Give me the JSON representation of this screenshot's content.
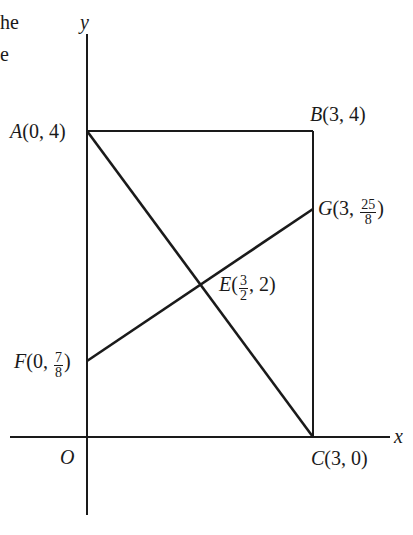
{
  "cut_text": {
    "line1": "he",
    "line2": "e"
  },
  "axes": {
    "x_label": "x",
    "y_label": "y",
    "origin_label": "O"
  },
  "points": {
    "A": {
      "name": "A",
      "coords": "(0, 4)"
    },
    "B": {
      "name": "B",
      "coords": "(3, 4)"
    },
    "C": {
      "name": "C",
      "coords": "(3, 0)"
    },
    "E": {
      "name": "E",
      "prefix": "(",
      "frac_num": "3",
      "frac_den": "2",
      "suffix": ", 2)"
    },
    "F": {
      "name": "F",
      "prefix": "(0, ",
      "frac_num": "7",
      "frac_den": "8",
      "suffix": ")"
    },
    "G": {
      "name": "G",
      "prefix": "(3, ",
      "frac_num": "25",
      "frac_den": "8",
      "suffix": ")"
    }
  },
  "colors": {
    "line": "#1a1a1a",
    "background": "#ffffff"
  }
}
